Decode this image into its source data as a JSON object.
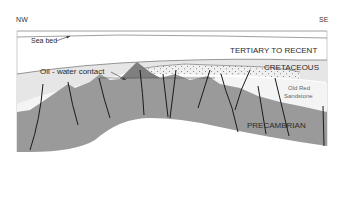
{
  "diagram": {
    "type": "geological-cross-section",
    "orientation": {
      "left": "NW",
      "right": "SE"
    },
    "labels": {
      "sea_bed": "Sea bed",
      "tertiary": "TERTIARY TO RECENT",
      "cretaceous": "CRETACEOUS",
      "oil_water_contact": "Oil - water contact",
      "old_red_1": "Old Red",
      "old_red_2": "Sandstone",
      "precambrian": "PRECAMBRIAN"
    },
    "colors": {
      "background": "#ffffff",
      "tertiary": "#ffffff",
      "cretaceous": "#e6e6e6",
      "old_red_sandstone": "#f4f4f4",
      "reservoir_dotted": "#efefef",
      "oil_column": "#8c8c8c",
      "precambrian": "#9a9a9a",
      "fault": "#1a1a1a",
      "frame": "#888888"
    }
  }
}
